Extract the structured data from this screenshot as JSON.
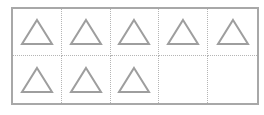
{
  "ten_frame": {
    "rows": 2,
    "columns": 5,
    "cells": [
      {
        "shape": "triangle"
      },
      {
        "shape": "triangle"
      },
      {
        "shape": "triangle"
      },
      {
        "shape": "triangle"
      },
      {
        "shape": "triangle"
      },
      {
        "shape": "triangle"
      },
      {
        "shape": "triangle"
      },
      {
        "shape": "triangle"
      },
      {
        "shape": "empty"
      },
      {
        "shape": "empty"
      }
    ],
    "filled_count": 8,
    "total_count": 10,
    "colors": {
      "border": "#a8a8a8",
      "divider": "#b5b5b5",
      "triangle_stroke": "#9e9e9e"
    }
  }
}
